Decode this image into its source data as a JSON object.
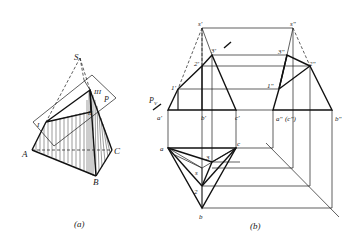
{
  "figure_a": {
    "caption": "(a)",
    "labels": {
      "S": "S",
      "A": "A",
      "B": "B",
      "C": "C",
      "I": "I",
      "II": "II",
      "III": "III",
      "P": "P"
    }
  },
  "figure_b": {
    "caption": "(b)",
    "front_view": {
      "s": "s'",
      "p1": "1'",
      "p2": "2'",
      "p3": "3'",
      "a": "a'",
      "b": "b'",
      "c": "c'",
      "plane": "P",
      "plane_sub": "V"
    },
    "side_view": {
      "s": "s\"",
      "p1": "1\"",
      "p2": "2\"",
      "p3": "3\"",
      "a": "a\"",
      "c": "(c\")",
      "b": "b\""
    },
    "top_view": {
      "a": "a",
      "b": "b",
      "c": "c",
      "s": "s",
      "p2": "2",
      "p3": "3"
    }
  }
}
